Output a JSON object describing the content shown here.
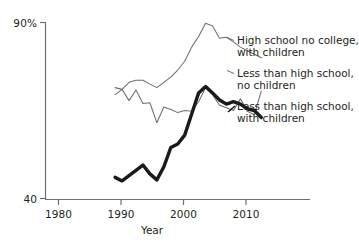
{
  "chart_data": {
    "type": "line",
    "title": "",
    "xlabel": "Year",
    "ylabel": "",
    "xlim": [
      1976,
      2014
    ],
    "ylim": [
      40,
      90
    ],
    "xticks": [
      1980,
      1990,
      2000,
      2010
    ],
    "xticklabels": [
      "1980",
      "1990",
      "2000",
      "2010"
    ],
    "yticks": [
      40,
      90
    ],
    "yticklabels": [
      "40",
      "90%"
    ],
    "grid": false,
    "legend_position": "inline-right-of-lines",
    "series": [
      {
        "name": "High school no college, with children",
        "style": "thin",
        "x": [
          1986,
          1987,
          1988,
          1989,
          1990,
          1991,
          1992,
          1993,
          1994,
          1995,
          1996,
          1997,
          1998,
          1999,
          2000,
          2001,
          2002,
          2003,
          2004,
          2005,
          2006,
          2007
        ],
        "values": [
          71.5,
          71.0,
          73.0,
          73.6,
          73.6,
          72.5,
          71.5,
          73.0,
          74.5,
          76.5,
          79.0,
          83.0,
          86.0,
          89.8,
          89.0,
          85.5,
          85.8,
          84.5,
          83.0,
          82.0,
          81.0,
          80.0
        ]
      },
      {
        "name": "Less than high school, no children",
        "style": "thin",
        "x": [
          1986,
          1987,
          1988,
          1989,
          1990,
          1991,
          1992,
          1993,
          1994,
          1995,
          1996,
          1997,
          1998,
          1999,
          2000,
          2001,
          2002,
          2003,
          2004,
          2005,
          2006,
          2007
        ],
        "values": [
          69.5,
          71.0,
          67.8,
          70.8,
          67.0,
          67.2,
          61.5,
          66.0,
          65.3,
          64.4,
          65.0,
          64.8,
          67.5,
          71.5,
          69.5,
          66.5,
          65.8,
          65.0,
          68.3,
          64.8,
          63.8,
          70.5
        ]
      },
      {
        "name": "Less than high school, with children",
        "style": "thick",
        "x": [
          1986,
          1987,
          1988,
          1989,
          1990,
          1991,
          1992,
          1993,
          1994,
          1995,
          1996,
          1997,
          1998,
          1999,
          2000,
          2001,
          2002,
          2003,
          2004,
          2005,
          2006,
          2007
        ],
        "values": [
          46.0,
          45.0,
          46.5,
          48.0,
          49.5,
          47.0,
          45.3,
          49.0,
          54.5,
          55.5,
          58.0,
          64.0,
          70.0,
          71.8,
          70.0,
          68.0,
          66.8,
          67.5,
          66.8,
          65.5,
          65.0,
          63.0
        ]
      }
    ],
    "series_labels": [
      {
        "line1": "High school no college,",
        "line2": "with children"
      },
      {
        "line1": "Less than high school,",
        "line2": "no children"
      },
      {
        "line1": "Less than high school,",
        "line2": "with children"
      }
    ],
    "colors": {
      "axis": "#6d6e71",
      "thin_line": "#6d6e71",
      "thick_line": "#1a1a1a",
      "text": "#231f20",
      "background": "#ffffff"
    }
  }
}
